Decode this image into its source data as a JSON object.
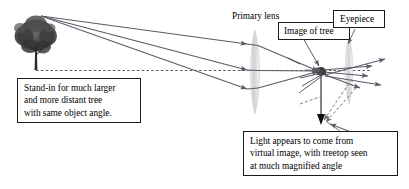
{
  "figure": {
    "background_color": "#ffffff",
    "ray_color": "#5a5a68",
    "axis_color": "#4d4d4d",
    "lens_color": "#d6d6d6",
    "text_color": "#000000",
    "border_color": "#1a1a1a"
  },
  "labels": {
    "primary_lens": "Primary lens",
    "image_of_tree": "Image of tree",
    "eyepiece": "Eyepiece"
  },
  "callouts": {
    "standin": "Stand-in for much larger\nand more distant tree\nwith same object angle.",
    "virtual_image": "Light appears to come from\nvirtual image, with treetop seen\nat much magnified angle"
  },
  "objects": {
    "tree": {
      "name": "tree",
      "description": "stand-in tree object at left"
    },
    "optical_axis": {
      "name": "optical-axis",
      "style": "dashed"
    },
    "primary_lens": {
      "name": "primary-lens",
      "shape": "biconvex"
    },
    "eyepiece_lens": {
      "name": "eyepiece-lens",
      "shape": "biconvex"
    },
    "image_point": {
      "name": "image-point",
      "description": "real inverted image formed by primary lens"
    },
    "virtual_image_marker": {
      "name": "virtual-image-arrow",
      "description": "downward arrow marking virtual image position"
    }
  },
  "rays": {
    "object_rays_count": 3,
    "eyepiece_output_rays_count": 5,
    "virtual_extension_rays_count": 3
  }
}
